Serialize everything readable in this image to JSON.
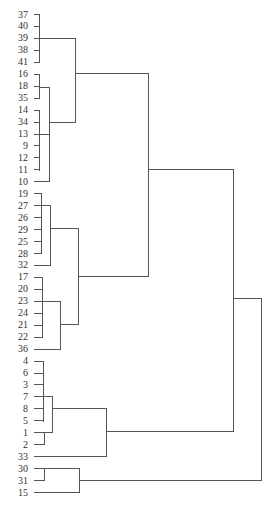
{
  "chart_data": {
    "type": "dendrogram",
    "orientation": "horizontal",
    "title": "",
    "leaves": [
      "37",
      "40",
      "39",
      "38",
      "41",
      "16",
      "18",
      "35",
      "14",
      "34",
      "13",
      "9",
      "12",
      "11",
      "10",
      "19",
      "27",
      "26",
      "29",
      "25",
      "28",
      "32",
      "17",
      "20",
      "23",
      "24",
      "21",
      "22",
      "36",
      "4",
      "6",
      "3",
      "7",
      "8",
      "5",
      "1",
      "2",
      "33",
      "30",
      "31",
      "15"
    ],
    "leaf_layout": {
      "y_start": 14,
      "y_step": 11.95,
      "label_x": 28,
      "tick_x": 33
    },
    "merges": [
      {
        "id": "A",
        "members": [
          "37",
          "40",
          "39",
          "38",
          "41"
        ],
        "x": 39,
        "y_top": 14,
        "y_bot": 62,
        "out_y": 38
      },
      {
        "id": "B",
        "members": [
          "16",
          "18",
          "35"
        ],
        "x": 39,
        "y_top": 74,
        "y_bot": 98,
        "out_y": 87
      },
      {
        "id": "C",
        "members": [
          "14",
          "34",
          "13",
          "9",
          "12",
          "11"
        ],
        "x": 39,
        "y_top": 110,
        "y_bot": 170,
        "out_y": 134
      },
      {
        "id": "D",
        "children": [
          "B",
          "C",
          "10"
        ],
        "x": 49,
        "y_top": 87,
        "y_bot": 181,
        "out_y": 122
      },
      {
        "id": "E",
        "children": [
          "A",
          "D"
        ],
        "x": 75,
        "y_top": 38,
        "y_bot": 122,
        "out_y": 73
      },
      {
        "id": "F",
        "members": [
          "19",
          "27",
          "26",
          "29",
          "25",
          "28"
        ],
        "x": 41,
        "y_top": 193,
        "y_bot": 253,
        "out_y": 205
      },
      {
        "id": "G",
        "children": [
          "F",
          "32"
        ],
        "x": 50,
        "y_top": 205,
        "y_bot": 265,
        "out_y": 228
      },
      {
        "id": "H",
        "members": [
          "17",
          "20",
          "23",
          "24",
          "21",
          "22"
        ],
        "x": 42,
        "y_top": 277,
        "y_bot": 337,
        "out_y": 301
      },
      {
        "id": "I",
        "children": [
          "H",
          "36"
        ],
        "x": 60,
        "y_top": 301,
        "y_bot": 349,
        "out_y": 324
      },
      {
        "id": "J",
        "children": [
          "G",
          "I"
        ],
        "x": 78,
        "y_top": 228,
        "y_bot": 324,
        "out_y": 276
      },
      {
        "id": "K",
        "children": [
          "E",
          "J"
        ],
        "x": 148,
        "y_top": 73,
        "y_bot": 276,
        "out_y": 169
      },
      {
        "id": "L",
        "members": [
          "4",
          "6",
          "3",
          "7",
          "8",
          "5"
        ],
        "x": 43,
        "y_top": 361,
        "y_bot": 421,
        "out_y": 396
      },
      {
        "id": "M",
        "members": [
          "1",
          "2"
        ],
        "x": 44,
        "y_top": 432,
        "y_bot": 444,
        "out_y": 432
      },
      {
        "id": "N",
        "children": [
          "L",
          "M"
        ],
        "x": 52,
        "y_top": 396,
        "y_bot": 432,
        "out_y": 408
      },
      {
        "id": "O",
        "children": [
          "N",
          "33"
        ],
        "x": 106,
        "y_top": 408,
        "y_bot": 456,
        "out_y": 431
      },
      {
        "id": "P",
        "children": [
          "K",
          "O"
        ],
        "x": 233,
        "y_top": 169,
        "y_bot": 431,
        "out_y": 298
      },
      {
        "id": "Q",
        "members": [
          "30",
          "31"
        ],
        "x": 44,
        "y_top": 468,
        "y_bot": 480,
        "out_y": 468
      },
      {
        "id": "R",
        "children": [
          "Q",
          "15"
        ],
        "x": 79,
        "y_top": 468,
        "y_bot": 492,
        "out_y": 480
      },
      {
        "id": "S",
        "children": [
          "P",
          "R"
        ],
        "x": 261,
        "y_top": 298,
        "y_bot": 480,
        "out_y": null
      }
    ],
    "xlabel": "",
    "ylabel": "",
    "grid": false
  }
}
